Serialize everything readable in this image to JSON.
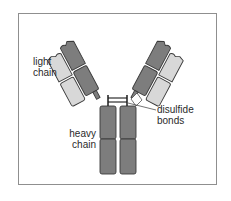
{
  "diagram": {
    "colors": {
      "heavy_chain": "#7d7d7d",
      "light_chain": "#d8d8d8",
      "outline": "#3a3a3a",
      "frame": "#8f8f8f",
      "text": "#2a2a2a"
    },
    "labels": {
      "light_chain": [
        "light",
        "chain"
      ],
      "heavy_chain": [
        "heavy",
        "chain"
      ],
      "disulfide_bonds": [
        "disulfide",
        "bonds"
      ]
    }
  }
}
